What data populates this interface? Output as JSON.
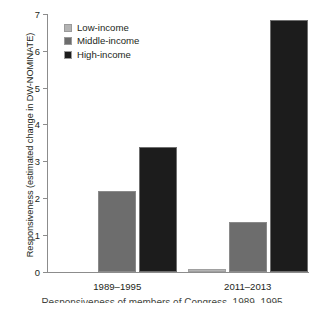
{
  "chart_data": {
    "type": "bar",
    "title": "",
    "xlabel": "",
    "ylabel": "Responsiveness (estimated change in DW-NOMINATE)",
    "categories": [
      "1989–1995",
      "2011–2013"
    ],
    "series": [
      {
        "name": "Low-income",
        "color": "#b3b3b3",
        "values": [
          0,
          0.08
        ]
      },
      {
        "name": "Middle-income",
        "color": "#6d6d6d",
        "values": [
          2.2,
          1.35
        ]
      },
      {
        "name": "High-income",
        "color": "#1c1c1c",
        "values": [
          3.4,
          6.85
        ]
      }
    ],
    "ylim": [
      0,
      7
    ],
    "yticks": [
      0,
      1,
      2,
      3,
      4,
      5,
      6,
      7
    ],
    "ytick_labels": [
      "0",
      "1",
      "2",
      "3",
      "4",
      "5",
      "6",
      "7"
    ],
    "grid": false,
    "legend_position": "top-left"
  },
  "legend": {
    "items": [
      {
        "label": "Low-income",
        "swatch": "low"
      },
      {
        "label": "Middle-income",
        "swatch": "mid"
      },
      {
        "label": "High-income",
        "swatch": "high"
      }
    ]
  },
  "caption": {
    "fragment": "Responsiveness of members of Congress, 1989–1995"
  }
}
